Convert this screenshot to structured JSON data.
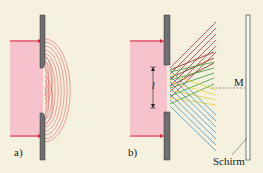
{
  "figure": {
    "panel_a": {
      "label": "a)"
    },
    "panel_b": {
      "label": "b)",
      "slit_width_symbol": "l",
      "center_marker": "M",
      "screen_label": "Schirm"
    }
  },
  "colors": {
    "background": "#f6f0de",
    "beam": "#f6c2cc",
    "barrier": "#6f6f70",
    "arrow": "#d6283c",
    "wave": "#d8333f",
    "ray_red": "#d8344a",
    "ray_darkred": "#7a2a1c",
    "ray_green": "#3c9a3a",
    "ray_yellow": "#e6d23a",
    "ray_blue": "#3d96c8"
  }
}
